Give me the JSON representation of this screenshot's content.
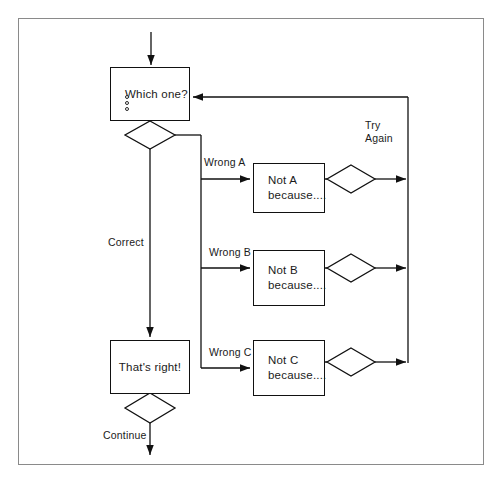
{
  "diagram": {
    "frame": {
      "visible": true,
      "border_color": "#8a8a8a"
    },
    "line_color": "#111111",
    "text_color": "#1a1a1a",
    "nodes": [
      {
        "id": "question",
        "type": "process",
        "lines": [
          "Which one?"
        ],
        "options_count": 3,
        "x": 110,
        "y": 67,
        "w": 80,
        "h": 54
      },
      {
        "id": "not_a",
        "type": "process",
        "lines": [
          "Not A",
          "because...."
        ],
        "x": 253,
        "y": 163,
        "w": 72,
        "h": 50
      },
      {
        "id": "not_b",
        "type": "process",
        "lines": [
          "Not B",
          "because...."
        ],
        "x": 253,
        "y": 250,
        "w": 72,
        "h": 56
      },
      {
        "id": "not_c",
        "type": "process",
        "lines": [
          "Not C",
          "because...."
        ],
        "x": 253,
        "y": 340,
        "w": 72,
        "h": 56
      },
      {
        "id": "thats_right",
        "type": "process",
        "lines": [
          "That's  right!"
        ],
        "x": 110,
        "y": 340,
        "w": 80,
        "h": 54
      }
    ],
    "decisions": [
      {
        "id": "question-decision",
        "cx": 150,
        "cy": 135,
        "rx": 25,
        "ry": 14
      },
      {
        "id": "retry-a-decision",
        "cx": 351,
        "cy": 179,
        "rx": 24,
        "ry": 14
      },
      {
        "id": "retry-b-decision",
        "cx": 351,
        "cy": 268,
        "rx": 24,
        "ry": 14
      },
      {
        "id": "retry-c-decision",
        "cx": 351,
        "cy": 362,
        "rx": 24,
        "ry": 14
      },
      {
        "id": "continue-decision",
        "cx": 150,
        "cy": 408,
        "rx": 25,
        "ry": 15
      }
    ],
    "edge_labels": [
      {
        "id": "wrong-a",
        "text": "Wrong A",
        "x": 204,
        "y": 156
      },
      {
        "id": "wrong-b",
        "text": "Wrong B",
        "x": 209,
        "y": 246
      },
      {
        "id": "wrong-c",
        "text": "Wrong C",
        "x": 209,
        "y": 346
      },
      {
        "id": "correct",
        "text": "Correct",
        "x": 108,
        "y": 236
      },
      {
        "id": "continue",
        "text": "Continue",
        "x": 103,
        "y": 429
      },
      {
        "id": "try-again-line1",
        "text": "Try",
        "x": 365,
        "y": 119
      },
      {
        "id": "try-again-line2",
        "text": "Again",
        "x": 365,
        "y": 132
      }
    ]
  }
}
